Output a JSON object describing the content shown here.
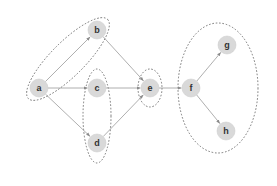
{
  "diagram": {
    "type": "directed-graph-with-clusters",
    "colors": {
      "node_fill": "#d9d9d9",
      "node_stroke": "#cfcfcf",
      "edge": "#9a9a9a",
      "cluster_stroke": "#6a6a6a",
      "label": "#333333"
    },
    "nodes": [
      {
        "id": "a",
        "label": "a",
        "x": 39,
        "y": 88
      },
      {
        "id": "b",
        "label": "b",
        "x": 97,
        "y": 30
      },
      {
        "id": "c",
        "label": "c",
        "x": 97,
        "y": 88
      },
      {
        "id": "d",
        "label": "d",
        "x": 97,
        "y": 143
      },
      {
        "id": "e",
        "label": "e",
        "x": 150,
        "y": 88
      },
      {
        "id": "f",
        "label": "f",
        "x": 191,
        "y": 88
      },
      {
        "id": "g",
        "label": "g",
        "x": 227,
        "y": 45
      },
      {
        "id": "h",
        "label": "h",
        "x": 226,
        "y": 131
      }
    ],
    "edges": [
      {
        "from": "a",
        "to": "b"
      },
      {
        "from": "a",
        "to": "c"
      },
      {
        "from": "a",
        "to": "d"
      },
      {
        "from": "b",
        "to": "e"
      },
      {
        "from": "c",
        "to": "e"
      },
      {
        "from": "d",
        "to": "e"
      },
      {
        "from": "e",
        "to": "f"
      },
      {
        "from": "f",
        "to": "g"
      },
      {
        "from": "f",
        "to": "h"
      }
    ],
    "clusters": [
      {
        "id": "cluster-ab",
        "members": [
          "a",
          "b"
        ],
        "cx": 68,
        "cy": 59,
        "rx": 56,
        "ry": 17,
        "rotate": -45
      },
      {
        "id": "cluster-cd",
        "members": [
          "c",
          "d"
        ],
        "cx": 97,
        "cy": 116,
        "rx": 14,
        "ry": 47,
        "rotate": 0
      },
      {
        "id": "cluster-e",
        "members": [
          "e"
        ],
        "cx": 150,
        "cy": 88,
        "rx": 12,
        "ry": 19,
        "rotate": 0
      },
      {
        "id": "cluster-fgh",
        "members": [
          "f",
          "g",
          "h"
        ],
        "cx": 218,
        "cy": 88,
        "rx": 40,
        "ry": 65,
        "rotate": 0
      }
    ]
  }
}
